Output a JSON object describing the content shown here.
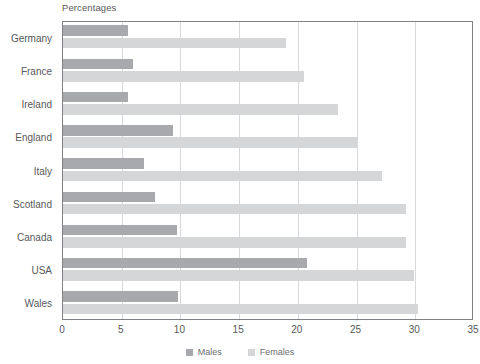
{
  "chart_data": {
    "type": "bar",
    "orientation": "horizontal",
    "title": "Percentages",
    "xlabel": "",
    "ylabel": "",
    "xlim": [
      0,
      35
    ],
    "xticks": [
      0,
      5,
      10,
      15,
      20,
      25,
      30,
      35
    ],
    "grid": "vertical",
    "legend_position": "bottom-center",
    "categories": [
      "Germany",
      "France",
      "Ireland",
      "England",
      "Italy",
      "Scotland",
      "Canada",
      "USA",
      "Wales"
    ],
    "series": [
      {
        "name": "Males",
        "color": "#a7a9ac",
        "values": [
          5.5,
          6.0,
          5.5,
          9.4,
          6.9,
          7.8,
          9.7,
          20.8,
          9.8
        ]
      },
      {
        "name": "Females",
        "color": "#d5d6d8",
        "values": [
          19.0,
          20.5,
          23.4,
          25.0,
          27.2,
          29.2,
          29.2,
          29.9,
          30.2
        ]
      }
    ]
  },
  "style": {
    "axis_color": "#818285",
    "grid_color": "#d8d9db",
    "text_color": "#58595b",
    "background": "#ffffff"
  }
}
